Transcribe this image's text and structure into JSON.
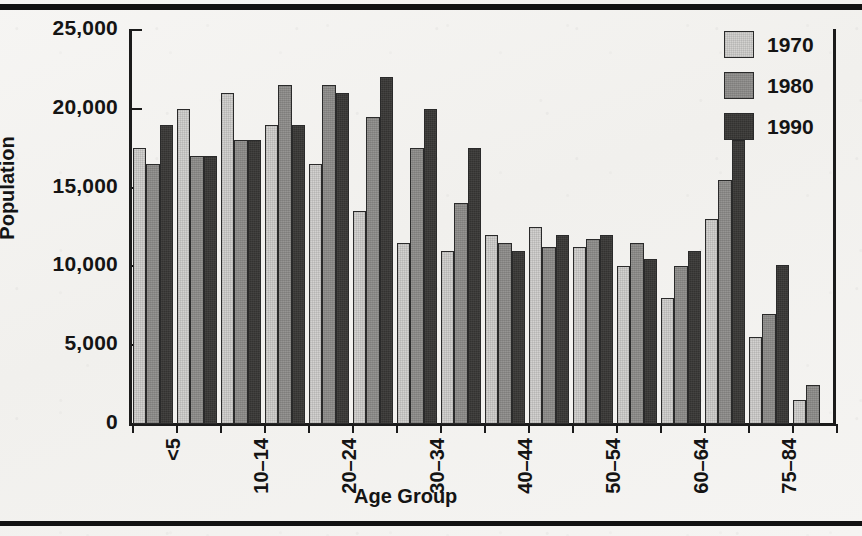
{
  "chart_data": {
    "type": "bar",
    "title": "",
    "xlabel": "Age Group",
    "ylabel": "Population",
    "ylim": [
      0,
      25000
    ],
    "ytick_labels": [
      "25,000",
      "20,000",
      "15,000",
      "10,000",
      "5,000",
      "0"
    ],
    "ytick_values": [
      25000,
      20000,
      15000,
      10000,
      5000,
      0
    ],
    "grid": false,
    "legend_position": "top-right",
    "categories": [
      "<5",
      "5-9",
      "10-14",
      "15-19",
      "20-24",
      "25-29",
      "30-34",
      "35-39",
      "40-44",
      "45-49",
      "50-54",
      "55-59",
      "60-64",
      "65-74",
      "75-84",
      "85+"
    ],
    "visible_tick_labels": [
      "<5",
      "10-14",
      "20-24",
      "30-34",
      "40-44",
      "50-54",
      "60-64",
      "75-84"
    ],
    "series": [
      {
        "name": "1970",
        "color": "#d3d2d0",
        "values": [
          17500,
          20000,
          21000,
          19000,
          16500,
          13500,
          11500,
          11000,
          12000,
          12500,
          11250,
          10000,
          8000,
          13000,
          5500,
          1500
        ]
      },
      {
        "name": "1980",
        "color": "#8d8c8a",
        "values": [
          16500,
          17000,
          18000,
          21500,
          21500,
          19500,
          17500,
          14000,
          11500,
          11250,
          11750,
          11500,
          10000,
          15500,
          7000,
          2500
        ]
      },
      {
        "name": "1990",
        "color": "#333230",
        "values": [
          19000,
          17000,
          18000,
          19000,
          21000,
          22000,
          20000,
          17500,
          11000,
          12000,
          12000,
          10500,
          11000,
          18000,
          10100,
          0
        ]
      }
    ]
  },
  "legend": {
    "items": [
      {
        "label": "1970"
      },
      {
        "label": "1980"
      },
      {
        "label": "1990"
      }
    ]
  },
  "axes": {
    "ylabel": "Population",
    "xlabel": "Age Group"
  }
}
